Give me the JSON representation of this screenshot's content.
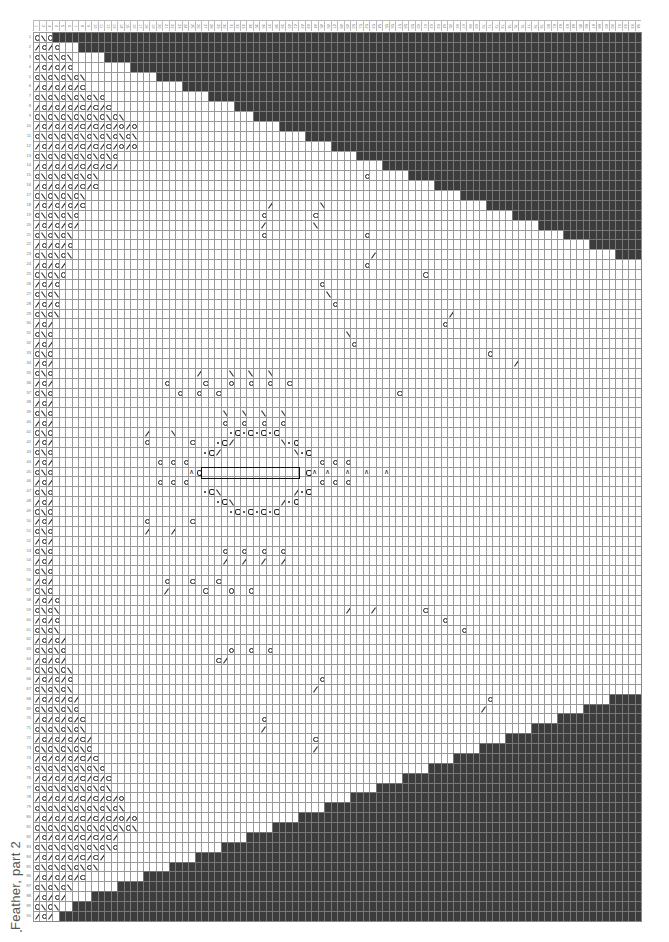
{
  "chart": {
    "title": "Feather, part 2",
    "columns": 94,
    "rows": 90,
    "cell_width": 6.47,
    "cell_height": 9.88,
    "colors": {
      "no_stitch": "#3c3c3c",
      "grid_line": "#9a9a9a",
      "background": "#ffffff",
      "symbol": "#222222"
    },
    "legend_symbols": {
      "yo": "yarn-over (circle)",
      "k2tog": "right-slanting decrease (/)",
      "ssk": "left-slanting decrease (\\)",
      "cdd": "centered double decrease (^)",
      "bobble": "bobble / nupp (circled)",
      "dot": "purl / dot"
    },
    "top_dark_start": [
      3,
      7,
      11,
      15,
      19,
      23,
      27,
      31,
      34,
      38,
      42,
      46,
      50,
      54,
      58,
      62,
      66,
      70,
      74,
      78,
      82,
      86,
      90,
      94
    ],
    "bottom_dark_start": [
      94,
      89,
      85,
      81,
      77,
      73,
      69,
      65,
      61,
      57,
      53,
      49,
      45,
      41,
      37,
      33,
      29,
      25,
      21,
      17,
      13,
      9,
      6,
      4
    ],
    "left_band_width": [
      3,
      4,
      6,
      6,
      8,
      8,
      11,
      12,
      14,
      16,
      16,
      16,
      13,
      13,
      10,
      10,
      8,
      8,
      7,
      7,
      6,
      6,
      6,
      5,
      5,
      4,
      4,
      4,
      4,
      3,
      3,
      3,
      3,
      3,
      3,
      3,
      3,
      3,
      3,
      3,
      3,
      3,
      3,
      3,
      3,
      3,
      3,
      3,
      3,
      3,
      3,
      3,
      3,
      3,
      3,
      3,
      3,
      4,
      4,
      4,
      4,
      5,
      5,
      5,
      6,
      6,
      6,
      7,
      7,
      8,
      8,
      9,
      9,
      10,
      11,
      12,
      12,
      14,
      14,
      16,
      16,
      13,
      13,
      11,
      10,
      8,
      6,
      5,
      4,
      3
    ],
    "motif_symbols": [
      {
        "r": 14,
        "c": 51,
        "s": "yo"
      },
      {
        "r": 15,
        "c": 63,
        "s": "yo"
      },
      {
        "r": 16,
        "c": 70,
        "s": "yo"
      },
      {
        "r": 17,
        "c": 36,
        "s": "k2tog"
      },
      {
        "r": 17,
        "c": 44,
        "s": "ssk"
      },
      {
        "r": 18,
        "c": 35,
        "s": "yo"
      },
      {
        "r": 18,
        "c": 43,
        "s": "yo"
      },
      {
        "r": 19,
        "c": 35,
        "s": "k2tog"
      },
      {
        "r": 19,
        "c": 43,
        "s": "ssk"
      },
      {
        "r": 20,
        "c": 35,
        "s": "yo"
      },
      {
        "r": 20,
        "c": 51,
        "s": "yo"
      },
      {
        "r": 22,
        "c": 52,
        "s": "k2tog"
      },
      {
        "r": 23,
        "c": 51,
        "s": "yo"
      },
      {
        "r": 24,
        "c": 60,
        "s": "yo"
      },
      {
        "r": 25,
        "c": 44,
        "s": "yo"
      },
      {
        "r": 26,
        "c": 45,
        "s": "ssk"
      },
      {
        "r": 27,
        "c": 46,
        "s": "yo"
      },
      {
        "r": 28,
        "c": 64,
        "s": "k2tog"
      },
      {
        "r": 29,
        "c": 63,
        "s": "yo"
      },
      {
        "r": 30,
        "c": 48,
        "s": "ssk"
      },
      {
        "r": 31,
        "c": 49,
        "s": "yo"
      },
      {
        "r": 32,
        "c": 70,
        "s": "yo"
      },
      {
        "r": 33,
        "c": 74,
        "s": "k2tog"
      },
      {
        "r": 34,
        "c": 25,
        "s": "k2tog"
      },
      {
        "r": 34,
        "c": 30,
        "s": "ssk"
      },
      {
        "r": 34,
        "c": 33,
        "s": "ssk"
      },
      {
        "r": 34,
        "c": 36,
        "s": "ssk"
      },
      {
        "r": 35,
        "c": 20,
        "s": "yo"
      },
      {
        "r": 35,
        "c": 26,
        "s": "yo"
      },
      {
        "r": 35,
        "c": 30,
        "s": "yo"
      },
      {
        "r": 35,
        "c": 33,
        "s": "yo"
      },
      {
        "r": 35,
        "c": 36,
        "s": "yo"
      },
      {
        "r": 35,
        "c": 39,
        "s": "yo"
      },
      {
        "r": 36,
        "c": 22,
        "s": "yo"
      },
      {
        "r": 36,
        "c": 25,
        "s": "yo"
      },
      {
        "r": 36,
        "c": 28,
        "s": "yo"
      },
      {
        "r": 36,
        "c": 56,
        "s": "yo"
      },
      {
        "r": 38,
        "c": 29,
        "s": "ssk"
      },
      {
        "r": 38,
        "c": 32,
        "s": "ssk"
      },
      {
        "r": 38,
        "c": 35,
        "s": "ssk"
      },
      {
        "r": 38,
        "c": 38,
        "s": "ssk"
      },
      {
        "r": 39,
        "c": 29,
        "s": "yo"
      },
      {
        "r": 39,
        "c": 32,
        "s": "yo"
      },
      {
        "r": 39,
        "c": 35,
        "s": "yo"
      },
      {
        "r": 39,
        "c": 38,
        "s": "yo"
      },
      {
        "r": 40,
        "c": 17,
        "s": "k2tog"
      },
      {
        "r": 40,
        "c": 21,
        "s": "ssk"
      },
      {
        "r": 41,
        "c": 17,
        "s": "yo"
      },
      {
        "r": 41,
        "c": 24,
        "s": "yo"
      },
      {
        "r": 40,
        "c": 30,
        "s": "dot"
      },
      {
        "r": 40,
        "c": 31,
        "s": "bobble"
      },
      {
        "r": 40,
        "c": 32,
        "s": "dot"
      },
      {
        "r": 40,
        "c": 33,
        "s": "bobble"
      },
      {
        "r": 40,
        "c": 34,
        "s": "dot"
      },
      {
        "r": 40,
        "c": 35,
        "s": "bobble"
      },
      {
        "r": 40,
        "c": 36,
        "s": "dot"
      },
      {
        "r": 40,
        "c": 37,
        "s": "bobble"
      },
      {
        "r": 41,
        "c": 28,
        "s": "dot"
      },
      {
        "r": 41,
        "c": 29,
        "s": "bobble"
      },
      {
        "r": 41,
        "c": 30,
        "s": "k2tog"
      },
      {
        "r": 41,
        "c": 38,
        "s": "ssk"
      },
      {
        "r": 41,
        "c": 39,
        "s": "dot"
      },
      {
        "r": 41,
        "c": 40,
        "s": "bobble"
      },
      {
        "r": 42,
        "c": 26,
        "s": "dot"
      },
      {
        "r": 42,
        "c": 27,
        "s": "bobble"
      },
      {
        "r": 42,
        "c": 28,
        "s": "k2tog"
      },
      {
        "r": 42,
        "c": 40,
        "s": "ssk"
      },
      {
        "r": 42,
        "c": 41,
        "s": "dot"
      },
      {
        "r": 42,
        "c": 42,
        "s": "bobble"
      },
      {
        "r": 43,
        "c": 19,
        "s": "yo"
      },
      {
        "r": 43,
        "c": 21,
        "s": "yo"
      },
      {
        "r": 43,
        "c": 23,
        "s": "yo"
      },
      {
        "r": 43,
        "c": 44,
        "s": "yo"
      },
      {
        "r": 43,
        "c": 46,
        "s": "yo"
      },
      {
        "r": 43,
        "c": 48,
        "s": "yo"
      },
      {
        "r": 44,
        "c": 24,
        "s": "cdd"
      },
      {
        "r": 44,
        "c": 25,
        "s": "bobble"
      },
      {
        "r": 44,
        "c": 42,
        "s": "bobble"
      },
      {
        "r": 44,
        "c": 43,
        "s": "cdd"
      },
      {
        "r": 44,
        "c": 45,
        "s": "cdd"
      },
      {
        "r": 44,
        "c": 48,
        "s": "cdd"
      },
      {
        "r": 44,
        "c": 51,
        "s": "cdd"
      },
      {
        "r": 44,
        "c": 54,
        "s": "cdd"
      },
      {
        "r": 45,
        "c": 19,
        "s": "yo"
      },
      {
        "r": 45,
        "c": 21,
        "s": "yo"
      },
      {
        "r": 45,
        "c": 23,
        "s": "yo"
      },
      {
        "r": 45,
        "c": 44,
        "s": "yo"
      },
      {
        "r": 45,
        "c": 46,
        "s": "yo"
      },
      {
        "r": 45,
        "c": 48,
        "s": "yo"
      },
      {
        "r": 46,
        "c": 26,
        "s": "dot"
      },
      {
        "r": 46,
        "c": 27,
        "s": "bobble"
      },
      {
        "r": 46,
        "c": 28,
        "s": "ssk"
      },
      {
        "r": 46,
        "c": 40,
        "s": "k2tog"
      },
      {
        "r": 46,
        "c": 41,
        "s": "dot"
      },
      {
        "r": 46,
        "c": 42,
        "s": "bobble"
      },
      {
        "r": 47,
        "c": 28,
        "s": "dot"
      },
      {
        "r": 47,
        "c": 29,
        "s": "bobble"
      },
      {
        "r": 47,
        "c": 30,
        "s": "ssk"
      },
      {
        "r": 47,
        "c": 38,
        "s": "k2tog"
      },
      {
        "r": 47,
        "c": 39,
        "s": "dot"
      },
      {
        "r": 47,
        "c": 40,
        "s": "bobble"
      },
      {
        "r": 48,
        "c": 30,
        "s": "dot"
      },
      {
        "r": 48,
        "c": 31,
        "s": "bobble"
      },
      {
        "r": 48,
        "c": 32,
        "s": "dot"
      },
      {
        "r": 48,
        "c": 33,
        "s": "bobble"
      },
      {
        "r": 48,
        "c": 34,
        "s": "dot"
      },
      {
        "r": 48,
        "c": 35,
        "s": "bobble"
      },
      {
        "r": 48,
        "c": 36,
        "s": "dot"
      },
      {
        "r": 48,
        "c": 37,
        "s": "bobble"
      },
      {
        "r": 49,
        "c": 17,
        "s": "yo"
      },
      {
        "r": 49,
        "c": 24,
        "s": "yo"
      },
      {
        "r": 50,
        "c": 17,
        "s": "k2tog"
      },
      {
        "r": 50,
        "c": 21,
        "s": "k2tog"
      },
      {
        "r": 52,
        "c": 29,
        "s": "yo"
      },
      {
        "r": 52,
        "c": 32,
        "s": "yo"
      },
      {
        "r": 52,
        "c": 35,
        "s": "yo"
      },
      {
        "r": 52,
        "c": 38,
        "s": "yo"
      },
      {
        "r": 53,
        "c": 29,
        "s": "k2tog"
      },
      {
        "r": 53,
        "c": 32,
        "s": "k2tog"
      },
      {
        "r": 53,
        "c": 35,
        "s": "k2tog"
      },
      {
        "r": 53,
        "c": 38,
        "s": "k2tog"
      },
      {
        "r": 55,
        "c": 20,
        "s": "yo"
      },
      {
        "r": 55,
        "c": 24,
        "s": "yo"
      },
      {
        "r": 55,
        "c": 28,
        "s": "yo"
      },
      {
        "r": 56,
        "c": 20,
        "s": "k2tog"
      },
      {
        "r": 56,
        "c": 26,
        "s": "yo"
      },
      {
        "r": 56,
        "c": 30,
        "s": "yo"
      },
      {
        "r": 56,
        "c": 33,
        "s": "yo"
      },
      {
        "r": 58,
        "c": 48,
        "s": "k2tog"
      },
      {
        "r": 58,
        "c": 52,
        "s": "k2tog"
      },
      {
        "r": 58,
        "c": 60,
        "s": "yo"
      },
      {
        "r": 59,
        "c": 63,
        "s": "yo"
      },
      {
        "r": 60,
        "c": 66,
        "s": "yo"
      },
      {
        "r": 62,
        "c": 30,
        "s": "yo"
      },
      {
        "r": 62,
        "c": 33,
        "s": "yo"
      },
      {
        "r": 62,
        "c": 36,
        "s": "yo"
      },
      {
        "r": 63,
        "c": 28,
        "s": "yo"
      },
      {
        "r": 63,
        "c": 29,
        "s": "k2tog"
      },
      {
        "r": 65,
        "c": 44,
        "s": "yo"
      },
      {
        "r": 66,
        "c": 43,
        "s": "k2tog"
      },
      {
        "r": 67,
        "c": 70,
        "s": "yo"
      },
      {
        "r": 68,
        "c": 69,
        "s": "k2tog"
      },
      {
        "r": 69,
        "c": 35,
        "s": "yo"
      },
      {
        "r": 70,
        "c": 35,
        "s": "k2tog"
      },
      {
        "r": 71,
        "c": 43,
        "s": "yo"
      },
      {
        "r": 72,
        "c": 43,
        "s": "k2tog"
      },
      {
        "r": 73,
        "c": 78,
        "s": "yo"
      },
      {
        "r": 74,
        "c": 74,
        "s": "yo"
      },
      {
        "r": 75,
        "c": 70,
        "s": "yo"
      },
      {
        "r": 76,
        "c": 66,
        "s": "yo"
      },
      {
        "r": 77,
        "c": 62,
        "s": "yo"
      },
      {
        "r": 79,
        "c": 47,
        "s": "yo"
      },
      {
        "r": 80,
        "c": 44,
        "s": "yo"
      },
      {
        "r": 81,
        "c": 40,
        "s": "yo"
      },
      {
        "r": 82,
        "c": 36,
        "s": "yo"
      },
      {
        "r": 83,
        "c": 27,
        "s": "yo"
      },
      {
        "r": 84,
        "c": 21,
        "s": "yo"
      },
      {
        "r": 86,
        "c": 20,
        "s": "yo"
      },
      {
        "r": 86,
        "c": 24,
        "s": "yo"
      },
      {
        "r": 88,
        "c": 10,
        "s": "yo"
      }
    ],
    "boxed_region": {
      "row": 44,
      "col_start": 26,
      "col_end": 41
    }
  }
}
